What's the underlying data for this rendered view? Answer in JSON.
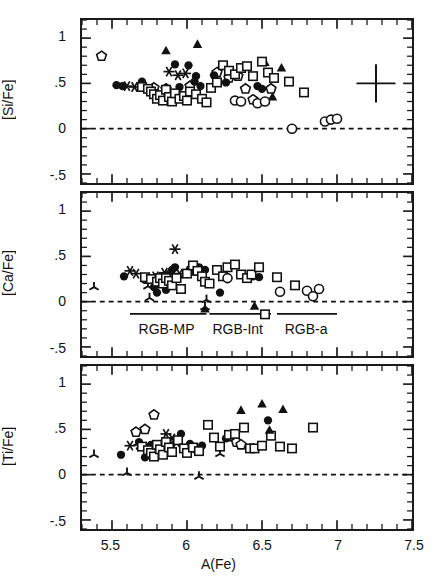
{
  "figure": {
    "xlabel": "A(Fe)",
    "xlim": [
      5.3,
      7.5
    ],
    "ylim": [
      -0.6,
      1.2
    ],
    "xticks_major": [
      5.5,
      6,
      6.5,
      7,
      7.5
    ],
    "xticklabels": [
      "5.5",
      "6",
      "6.5",
      "7",
      "7.5"
    ],
    "yticks_major": [
      -0.5,
      0,
      0.5,
      1
    ],
    "yticklabels": [
      "-.5",
      "0",
      ".5",
      "1"
    ],
    "zero_line": 0,
    "zero_line_style": "dashed",
    "minor_tick_step_x": 0.1,
    "minor_tick_step_y": 0.1,
    "frame_color": "#1a1a1a",
    "marker_color": "#111111",
    "group_labels": [
      {
        "text": "RGB-MP",
        "x_center": 5.87,
        "bar_from": 5.62,
        "bar_to": 6.13
      },
      {
        "text": "RGB-Int",
        "x_center": 6.34,
        "bar_from": 6.15,
        "bar_to": 6.56
      },
      {
        "text": "RGB-a",
        "x_center": 6.79,
        "bar_from": 6.6,
        "bar_to": 7.0
      }
    ],
    "error_bar": {
      "x": 7.26,
      "y": 0.5,
      "xerr": 0.13,
      "yerr": 0.21,
      "panel": 1
    }
  },
  "chart_data": [
    {
      "type": "scatter",
      "title": "",
      "ylabel": "[Si/Fe]",
      "xlabel": "A(Fe)",
      "xlim": [
        5.3,
        7.5
      ],
      "ylim": [
        -0.6,
        1.2
      ],
      "grid": false,
      "legend": "none",
      "series": [
        {
          "name": "open-pentagon",
          "marker": "pentagon-open",
          "points": [
            [
              5.43,
              0.8
            ],
            [
              5.78,
              0.45
            ],
            [
              5.86,
              0.44
            ],
            [
              6.02,
              0.47
            ],
            [
              6.2,
              0.62
            ],
            [
              6.28,
              0.56
            ],
            [
              6.34,
              0.58
            ],
            [
              6.39,
              0.44
            ],
            [
              6.44,
              0.32
            ],
            [
              6.56,
              0.44
            ]
          ]
        },
        {
          "name": "filled-triangle",
          "marker": "triangle-filled",
          "points": [
            [
              5.86,
              0.86
            ],
            [
              6.07,
              0.93
            ],
            [
              6.52,
              0.73
            ],
            [
              6.57,
              0.35
            ],
            [
              6.63,
              0.67
            ]
          ]
        },
        {
          "name": "filled-circle",
          "marker": "circle-filled",
          "points": [
            [
              5.53,
              0.48
            ],
            [
              5.57,
              0.47
            ],
            [
              5.7,
              0.52
            ],
            [
              5.76,
              0.43
            ],
            [
              5.79,
              0.39
            ],
            [
              5.83,
              0.36
            ],
            [
              5.92,
              0.71
            ],
            [
              5.95,
              0.46
            ],
            [
              6.01,
              0.7
            ],
            [
              6.05,
              0.52
            ],
            [
              6.06,
              0.58
            ],
            [
              6.09,
              0.47
            ],
            [
              6.18,
              0.59
            ],
            [
              6.2,
              0.52
            ],
            [
              6.26,
              0.51
            ],
            [
              6.47,
              0.47
            ],
            [
              6.5,
              0.44
            ]
          ]
        },
        {
          "name": "asterisk",
          "marker": "asterisk",
          "points": [
            [
              5.6,
              0.47
            ],
            [
              5.65,
              0.46
            ],
            [
              5.88,
              0.63
            ],
            [
              5.94,
              0.59
            ],
            [
              5.99,
              0.61
            ]
          ]
        },
        {
          "name": "open-square",
          "marker": "square-open",
          "points": [
            [
              5.7,
              0.46
            ],
            [
              5.74,
              0.44
            ],
            [
              5.76,
              0.41
            ],
            [
              5.78,
              0.38
            ],
            [
              5.8,
              0.33
            ],
            [
              5.82,
              0.37
            ],
            [
              5.84,
              0.31
            ],
            [
              5.86,
              0.43
            ],
            [
              5.88,
              0.35
            ],
            [
              5.9,
              0.3
            ],
            [
              5.92,
              0.39
            ],
            [
              5.95,
              0.33
            ],
            [
              5.98,
              0.36
            ],
            [
              6.0,
              0.31
            ],
            [
              6.02,
              0.41
            ],
            [
              6.06,
              0.38
            ],
            [
              6.1,
              0.33
            ],
            [
              6.13,
              0.29
            ],
            [
              6.16,
              0.45
            ],
            [
              6.2,
              0.51
            ],
            [
              6.24,
              0.7
            ],
            [
              6.28,
              0.64
            ],
            [
              6.32,
              0.6
            ],
            [
              6.36,
              0.67
            ],
            [
              6.4,
              0.69
            ],
            [
              6.44,
              0.58
            ],
            [
              6.5,
              0.74
            ],
            [
              6.54,
              0.62
            ],
            [
              6.58,
              0.56
            ],
            [
              6.68,
              0.52
            ],
            [
              6.78,
              0.4
            ]
          ]
        },
        {
          "name": "open-circle",
          "marker": "circle-open",
          "points": [
            [
              6.32,
              0.31
            ],
            [
              6.36,
              0.3
            ],
            [
              6.47,
              0.28
            ],
            [
              6.52,
              0.3
            ],
            [
              6.7,
              0.0
            ],
            [
              6.92,
              0.08
            ],
            [
              6.96,
              0.1
            ],
            [
              7.0,
              0.11
            ]
          ]
        }
      ]
    },
    {
      "type": "scatter",
      "title": "",
      "ylabel": "[Ca/Fe]",
      "xlabel": "A(Fe)",
      "xlim": [
        5.3,
        7.5
      ],
      "ylim": [
        -0.6,
        1.2
      ],
      "grid": false,
      "legend": "none",
      "series": [
        {
          "name": "tri-spoke",
          "marker": "tri-spoke",
          "points": [
            [
              5.38,
              0.16
            ],
            [
              5.74,
              0.17
            ],
            [
              5.75,
              0.04
            ],
            [
              6.12,
              -0.06
            ],
            [
              6.13,
              0.02
            ]
          ]
        },
        {
          "name": "asterisk",
          "marker": "asterisk",
          "points": [
            [
              5.62,
              0.34
            ],
            [
              5.66,
              0.31
            ],
            [
              5.79,
              0.28
            ],
            [
              5.85,
              0.32
            ],
            [
              5.88,
              0.3
            ],
            [
              5.92,
              0.58
            ],
            [
              5.95,
              0.31
            ]
          ]
        },
        {
          "name": "filled-circle",
          "marker": "circle-filled",
          "points": [
            [
              5.58,
              0.28
            ],
            [
              5.72,
              0.24
            ],
            [
              5.78,
              0.16
            ],
            [
              5.8,
              0.1
            ],
            [
              5.86,
              0.13
            ],
            [
              5.9,
              0.35
            ],
            [
              5.92,
              0.38
            ],
            [
              6.02,
              0.36
            ],
            [
              6.05,
              0.33
            ],
            [
              6.08,
              0.38
            ],
            [
              6.12,
              0.35
            ],
            [
              6.22,
              0.1
            ],
            [
              6.44,
              0.28
            ],
            [
              6.48,
              0.27
            ]
          ]
        },
        {
          "name": "open-square",
          "marker": "square-open",
          "points": [
            [
              5.72,
              0.27
            ],
            [
              5.76,
              0.25
            ],
            [
              5.8,
              0.22
            ],
            [
              5.82,
              0.26
            ],
            [
              5.84,
              0.2
            ],
            [
              5.86,
              0.26
            ],
            [
              5.88,
              0.23
            ],
            [
              5.9,
              0.18
            ],
            [
              5.93,
              0.26
            ],
            [
              5.96,
              0.14
            ],
            [
              6.0,
              0.31
            ],
            [
              6.04,
              0.4
            ],
            [
              6.07,
              0.34
            ],
            [
              6.1,
              0.28
            ],
            [
              6.12,
              0.22
            ],
            [
              6.15,
              0.2
            ],
            [
              6.2,
              0.35
            ],
            [
              6.24,
              0.28
            ],
            [
              6.27,
              0.38
            ],
            [
              6.32,
              0.41
            ],
            [
              6.36,
              0.3
            ],
            [
              6.4,
              0.26
            ],
            [
              6.43,
              0.3
            ],
            [
              6.48,
              0.38
            ],
            [
              6.52,
              -0.14
            ],
            [
              6.6,
              0.27
            ],
            [
              6.72,
              0.18
            ]
          ]
        },
        {
          "name": "open-circle",
          "marker": "circle-open",
          "points": [
            [
              6.27,
              0.26
            ],
            [
              6.62,
              0.11
            ],
            [
              6.8,
              0.12
            ],
            [
              6.84,
              0.06
            ],
            [
              6.88,
              0.14
            ]
          ]
        },
        {
          "name": "filled-triangle",
          "marker": "triangle-filled",
          "points": [
            [
              6.12,
              -0.08
            ],
            [
              6.45,
              -0.05
            ]
          ]
        }
      ]
    },
    {
      "type": "scatter",
      "title": "",
      "ylabel": "[Ti/Fe]",
      "xlabel": "A(Fe)",
      "xlim": [
        5.3,
        7.5
      ],
      "ylim": [
        -0.6,
        1.2
      ],
      "grid": false,
      "legend": "none",
      "series": [
        {
          "name": "tri-spoke",
          "marker": "tri-spoke",
          "points": [
            [
              5.38,
              0.22
            ],
            [
              5.6,
              0.02
            ],
            [
              6.08,
              -0.02
            ],
            [
              6.22,
              0.23
            ]
          ]
        },
        {
          "name": "open-pentagon",
          "marker": "pentagon-open",
          "points": [
            [
              5.66,
              0.47
            ],
            [
              5.72,
              0.5
            ],
            [
              5.78,
              0.66
            ],
            [
              6.3,
              0.42
            ],
            [
              6.33,
              0.36
            ],
            [
              6.36,
              0.33
            ]
          ]
        },
        {
          "name": "asterisk",
          "marker": "asterisk",
          "points": [
            [
              5.62,
              0.32
            ],
            [
              5.68,
              0.33
            ],
            [
              5.86,
              0.45
            ],
            [
              5.9,
              0.4
            ],
            [
              5.93,
              0.36
            ]
          ]
        },
        {
          "name": "filled-circle",
          "marker": "circle-filled",
          "points": [
            [
              5.56,
              0.22
            ],
            [
              5.68,
              0.36
            ],
            [
              5.72,
              0.19
            ],
            [
              5.76,
              0.33
            ],
            [
              5.8,
              0.3
            ],
            [
              5.96,
              0.45
            ],
            [
              6.02,
              0.34
            ],
            [
              6.06,
              0.27
            ],
            [
              6.1,
              0.32
            ],
            [
              6.26,
              0.4
            ],
            [
              6.54,
              0.6
            ]
          ]
        },
        {
          "name": "open-square",
          "marker": "square-open",
          "points": [
            [
              5.7,
              0.31
            ],
            [
              5.74,
              0.27
            ],
            [
              5.76,
              0.24
            ],
            [
              5.78,
              0.2
            ],
            [
              5.8,
              0.33
            ],
            [
              5.82,
              0.28
            ],
            [
              5.84,
              0.22
            ],
            [
              5.86,
              0.36
            ],
            [
              5.88,
              0.3
            ],
            [
              5.9,
              0.25
            ],
            [
              5.94,
              0.38
            ],
            [
              5.98,
              0.29
            ],
            [
              6.0,
              0.24
            ],
            [
              6.04,
              0.3
            ],
            [
              6.08,
              0.26
            ],
            [
              6.14,
              0.55
            ],
            [
              6.18,
              0.41
            ],
            [
              6.22,
              0.31
            ],
            [
              6.28,
              0.44
            ],
            [
              6.32,
              0.45
            ],
            [
              6.38,
              0.52
            ],
            [
              6.42,
              0.29
            ],
            [
              6.45,
              0.29
            ],
            [
              6.5,
              0.32
            ],
            [
              6.56,
              0.43
            ],
            [
              6.62,
              0.31
            ],
            [
              6.7,
              0.29
            ],
            [
              6.84,
              0.52
            ]
          ]
        },
        {
          "name": "filled-triangle",
          "marker": "triangle-filled",
          "points": [
            [
              6.36,
              0.71
            ],
            [
              6.5,
              0.78
            ],
            [
              6.55,
              0.49
            ],
            [
              6.64,
              0.72
            ]
          ]
        }
      ]
    }
  ]
}
